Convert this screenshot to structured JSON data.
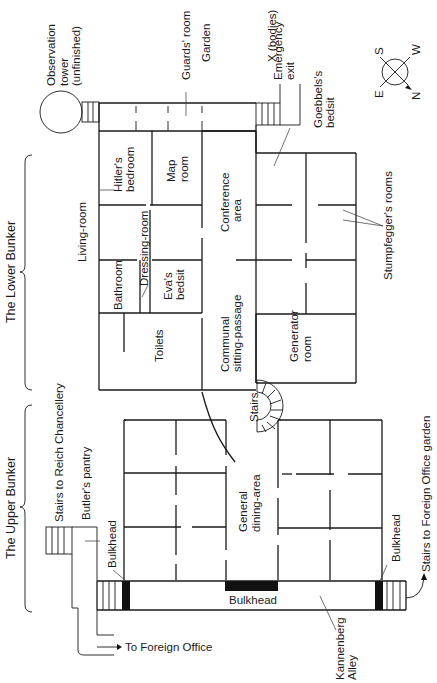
{
  "diagram": {
    "type": "floor-plan",
    "sections": {
      "lower_bunker": "The Lower Bunker",
      "upper_bunker": "The Upper Bunker"
    },
    "rooms": {
      "observation_tower_line1": "Observation",
      "observation_tower_line2": "tower",
      "observation_tower_line3": "(unfinished)",
      "guards_room": "Guards' room",
      "garden": "Garden",
      "bodies": "X (bodies)",
      "emergency_exit_line1": "Emergency",
      "emergency_exit_line2": "exit",
      "goebbels_line1": "Goebbels's",
      "goebbels_line2": "bedsit",
      "hitler_bedroom_line1": "Hitler's",
      "hitler_bedroom_line2": "bedroom",
      "map_room_line1": "Map",
      "map_room_line2": "room",
      "living_room": "Living-room",
      "dressing_room": "Dressing-room",
      "conference_line1": "Conference",
      "conference_line2": "area",
      "stumpfegger": "Stumpfegger's rooms",
      "bathroom": "Bathroom",
      "eva_line1": "Eva's",
      "eva_line2": "bedsit",
      "toilets": "Toilets",
      "communal_line1": "Communal",
      "communal_line2": "sitting-passage",
      "generator_line1": "Generator",
      "generator_line2": "room",
      "stairs": "Stairs",
      "dining_line1": "General",
      "dining_line2": "dining-area",
      "stairs_reich": "Stairs to Reich Chancellery",
      "butlers_pantry": "Butler's pantry",
      "bulkhead_left": "Bulkhead",
      "bulkhead_center": "Bulkhead",
      "bulkhead_right": "Bulkhead",
      "stairs_foreign_garden": "Stairs to Foreign Office garden",
      "to_foreign_office": "To Foreign Office",
      "kannenberg_line1": "Kannenberg",
      "kannenberg_line2": "Alley"
    },
    "compass": {
      "n": "N",
      "s": "S",
      "e": "E",
      "w": "W"
    }
  }
}
